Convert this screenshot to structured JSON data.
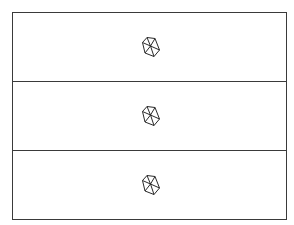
{
  "diagram": {
    "panel_count": 3,
    "panels": [
      {
        "icon": "polyhedron-icon"
      },
      {
        "icon": "polyhedron-icon"
      },
      {
        "icon": "polyhedron-icon"
      }
    ]
  },
  "colors": {
    "line": "#3a3a3a",
    "background": "#ffffff"
  }
}
